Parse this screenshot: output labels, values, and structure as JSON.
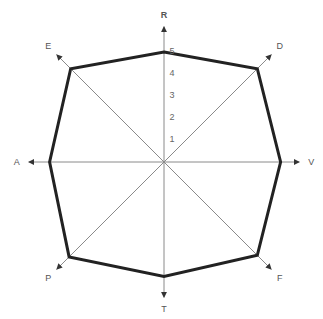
{
  "chart_data": {
    "type": "radar",
    "title": "",
    "axes": [
      "R",
      "D",
      "V",
      "F",
      "T",
      "P",
      "A",
      "E"
    ],
    "series": [
      {
        "name": "",
        "values": [
          5.0,
          6.0,
          5.3,
          6.0,
          5.2,
          6.1,
          5.2,
          6.0
        ]
      }
    ],
    "radial_ticks": [
      "1",
      "2",
      "3",
      "4",
      "5"
    ],
    "radial_range": [
      0,
      5
    ],
    "grid": false,
    "legend": false
  },
  "colors": {
    "polygon": "#222222",
    "axis": "#8a8a8a",
    "label": "#555555"
  }
}
